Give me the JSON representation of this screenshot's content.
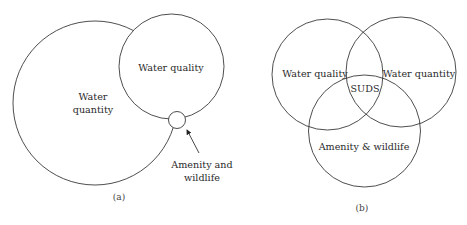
{
  "diagram_a": {
    "caption": "(a)",
    "circles": {
      "water_quantity": {
        "label_line1": "Water",
        "label_line2": "quantity"
      },
      "water_quality": {
        "label": "Water quality"
      },
      "amenity_wildlife": {
        "label_line1": "Amenity and",
        "label_line2": "wildlife"
      }
    }
  },
  "diagram_b": {
    "caption": "(b)",
    "circles": {
      "water_quality": {
        "label": "Water quality"
      },
      "water_quantity": {
        "label": "Water quantity"
      },
      "amenity_wildlife": {
        "label": "Amenity & wildlife"
      }
    },
    "center_label": "SUDS"
  },
  "colors": {
    "stroke": "#3a3a3a",
    "text": "#2a2a2a",
    "background": "#ffffff"
  }
}
